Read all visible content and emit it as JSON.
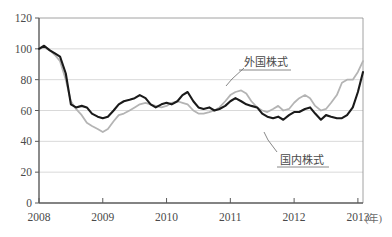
{
  "chart_data": {
    "type": "line",
    "title": "",
    "subtitle": "",
    "xlabel": "(年)",
    "ylabel": "",
    "xlim": [
      2008.0,
      2013.08
    ],
    "ylim": [
      0,
      120
    ],
    "yticks": [
      0,
      20,
      40,
      60,
      80,
      100,
      120
    ],
    "ytick_labels": [
      "0",
      "20",
      "40",
      "60",
      "80",
      "100",
      "120"
    ],
    "xticks": [
      2008,
      2009,
      2010,
      2011,
      2012,
      2013
    ],
    "xtick_labels": [
      "2008",
      "2009",
      "2010",
      "2011",
      "2012",
      "2013"
    ],
    "grid": "horizontal",
    "legend_position": "inline-annotations",
    "series": [
      {
        "name": "外国株式",
        "color": "#b4b4b4",
        "annotation_label": "外国株式",
        "x": [
          2008.0,
          2008.08,
          2008.17,
          2008.25,
          2008.33,
          2008.42,
          2008.5,
          2008.58,
          2008.67,
          2008.75,
          2008.83,
          2008.92,
          2009.0,
          2009.08,
          2009.17,
          2009.25,
          2009.33,
          2009.42,
          2009.5,
          2009.58,
          2009.67,
          2009.75,
          2009.83,
          2009.92,
          2010.0,
          2010.08,
          2010.17,
          2010.25,
          2010.33,
          2010.42,
          2010.5,
          2010.58,
          2010.67,
          2010.75,
          2010.83,
          2010.92,
          2011.0,
          2011.08,
          2011.17,
          2011.25,
          2011.33,
          2011.42,
          2011.5,
          2011.58,
          2011.67,
          2011.75,
          2011.83,
          2011.92,
          2012.0,
          2012.08,
          2012.17,
          2012.25,
          2012.33,
          2012.42,
          2012.5,
          2012.58,
          2012.67,
          2012.75,
          2012.83,
          2012.92,
          2013.0,
          2013.08
        ],
        "values": [
          100,
          101,
          99,
          96,
          92,
          80,
          66,
          61,
          57,
          52,
          50,
          48,
          46,
          48,
          53,
          57,
          58,
          60,
          62,
          64,
          65,
          64,
          63,
          62,
          63,
          65,
          66,
          65,
          64,
          60,
          58,
          58,
          59,
          60,
          62,
          66,
          70,
          72,
          73,
          71,
          66,
          62,
          60,
          59,
          61,
          63,
          60,
          61,
          65,
          68,
          70,
          68,
          63,
          60,
          61,
          65,
          70,
          78,
          80,
          80,
          85,
          92
        ]
      },
      {
        "name": "国内株式",
        "color": "#1a1a1a",
        "annotation_label": "国内株式",
        "x": [
          2008.0,
          2008.08,
          2008.17,
          2008.25,
          2008.33,
          2008.42,
          2008.5,
          2008.58,
          2008.67,
          2008.75,
          2008.83,
          2008.92,
          2009.0,
          2009.08,
          2009.17,
          2009.25,
          2009.33,
          2009.42,
          2009.5,
          2009.58,
          2009.67,
          2009.75,
          2009.83,
          2009.92,
          2010.0,
          2010.08,
          2010.17,
          2010.25,
          2010.33,
          2010.42,
          2010.5,
          2010.58,
          2010.67,
          2010.75,
          2010.83,
          2010.92,
          2011.0,
          2011.08,
          2011.17,
          2011.25,
          2011.33,
          2011.42,
          2011.5,
          2011.58,
          2011.67,
          2011.75,
          2011.83,
          2011.92,
          2012.0,
          2012.08,
          2012.17,
          2012.25,
          2012.33,
          2012.42,
          2012.5,
          2012.58,
          2012.67,
          2012.75,
          2012.83,
          2012.92,
          2013.0,
          2013.08
        ],
        "values": [
          100,
          102,
          99,
          97,
          95,
          84,
          64,
          62,
          63,
          62,
          58,
          56,
          55,
          56,
          60,
          64,
          66,
          67,
          68,
          70,
          68,
          64,
          62,
          64,
          65,
          64,
          66,
          70,
          72,
          66,
          62,
          61,
          62,
          60,
          61,
          63,
          66,
          68,
          66,
          64,
          63,
          62,
          58,
          56,
          55,
          56,
          54,
          57,
          59,
          59,
          61,
          62,
          58,
          54,
          57,
          56,
          55,
          55,
          57,
          62,
          72,
          85
        ]
      }
    ],
    "annotations": [
      {
        "text": "外国株式",
        "target_series": "外国株式",
        "label_x": 247,
        "label_y": 60
      },
      {
        "text": "国内株式",
        "target_series": "国内株式",
        "label_x": 280,
        "label_y": 159
      }
    ]
  },
  "axis": {
    "unit_suffix": "(年)"
  }
}
